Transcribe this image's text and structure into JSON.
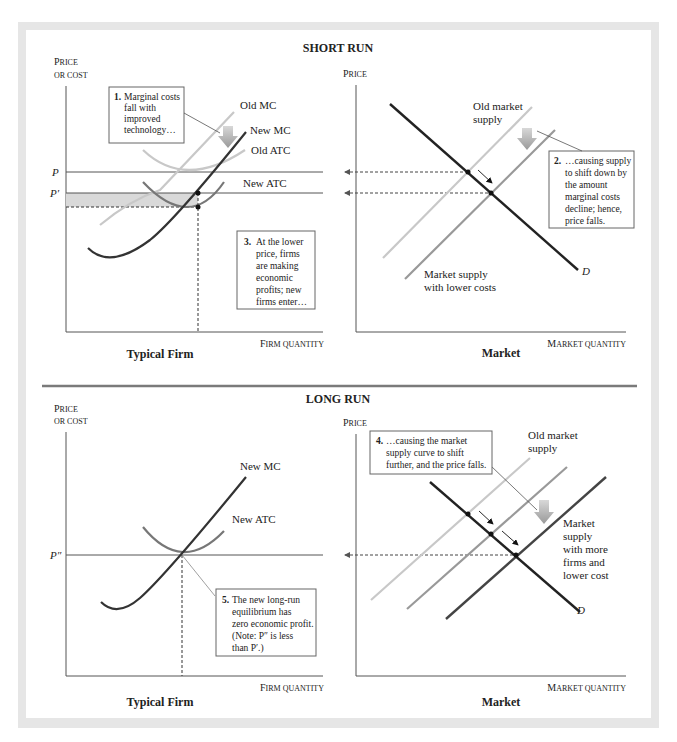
{
  "short_run": {
    "section_title": "SHORT RUN",
    "firm": {
      "y_label_1": "Price",
      "y_label_2": "or cost",
      "x_label": "Firm quantity",
      "caption": "Typical Firm",
      "price_labels": {
        "p": "P",
        "p_prime": "P′"
      },
      "curves": {
        "old_mc": "Old MC",
        "new_mc": "New MC",
        "old_atc": "Old ATC",
        "new_atc": "New ATC"
      },
      "callout_1": {
        "num": "1.",
        "lines": [
          "Marginal costs",
          "fall with",
          "improved",
          "technology…"
        ]
      },
      "callout_3": {
        "num": "3.",
        "lines": [
          "At the lower",
          "price, firms",
          "are making",
          "economic",
          "profits; new",
          "firms enter…"
        ]
      }
    },
    "market": {
      "y_label": "Price",
      "x_label": "Market quantity",
      "caption": "Market",
      "curves": {
        "old_supply_1": "Old market",
        "old_supply_2": "supply",
        "new_supply_1": "Market supply",
        "new_supply_2": "with lower costs",
        "demand": "D"
      },
      "callout_2": {
        "num": "2.",
        "lines": [
          "…causing supply",
          "to shift down by",
          "the amount",
          "marginal costs",
          "decline; hence,",
          "price falls."
        ]
      }
    }
  },
  "long_run": {
    "section_title": "LONG RUN",
    "firm": {
      "y_label_1": "Price",
      "y_label_2": "or cost",
      "x_label": "Firm quantity",
      "caption": "Typical Firm",
      "price_labels": {
        "p_double": "P″"
      },
      "curves": {
        "new_mc": "New MC",
        "new_atc": "New ATC"
      },
      "callout_5": {
        "num": "5.",
        "lines": [
          "The new long-run",
          "equilibrium has",
          "zero economic profit.",
          "(Note: P″ is less",
          "than P′.)"
        ]
      }
    },
    "market": {
      "y_label": "Price",
      "x_label": "Market quantity",
      "caption": "Market",
      "curves": {
        "old_supply_1": "Old market",
        "old_supply_2": "supply",
        "new_supply": [
          "Market",
          "supply",
          "with more",
          "firms and",
          "lower cost"
        ],
        "demand": "D"
      },
      "callout_4": {
        "num": "4.",
        "lines": [
          "…causing the market",
          "supply curve to shift",
          "further, and the price falls."
        ]
      }
    }
  },
  "colors": {
    "frame": "#e6e6e6",
    "divider": "#7a7a7a",
    "light_curve": "#c8c8c8",
    "mid_curve": "#9a9a9a",
    "dark_curve": "#333333",
    "shade": "#d9d9d9"
  }
}
